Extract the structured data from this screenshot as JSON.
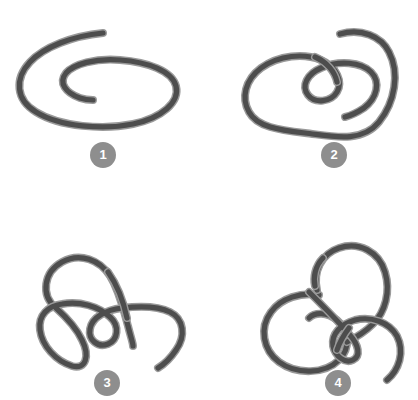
{
  "page": {
    "background_color": "#ffffff",
    "width": 418,
    "height": 400,
    "layout": "2x2-grid"
  },
  "style": {
    "rope_color": "#4d4d4d",
    "rope_outline_color": "#9a9a9a",
    "rope_stroke_width": 6,
    "rope_outline_width": 8,
    "badge_color": "#8e8e8e",
    "badge_text_color": "#ffffff",
    "badge_diameter": 26
  },
  "panels": [
    {
      "id": "panel-1",
      "badge_label": "1",
      "description": "loose open spiral loop, no crossings",
      "crossings": 0,
      "free_ends": 2
    },
    {
      "id": "panel-2",
      "badge_label": "2",
      "description": "large loop with one small inner twist loop",
      "crossings": 2,
      "free_ends": 2
    },
    {
      "id": "panel-3",
      "badge_label": "3",
      "description": "S-shaped rope with two small loops and an arch",
      "crossings": 3,
      "free_ends": 2
    },
    {
      "id": "panel-4",
      "badge_label": "4",
      "description": "two interlocking loops forming an overhand-style knot",
      "crossings": 4,
      "free_ends": 2
    }
  ],
  "chart_data": {
    "type": "diagram",
    "panel_labels": [
      "1",
      "2",
      "3",
      "4"
    ],
    "panel_crossings": [
      0,
      2,
      3,
      4
    ]
  }
}
